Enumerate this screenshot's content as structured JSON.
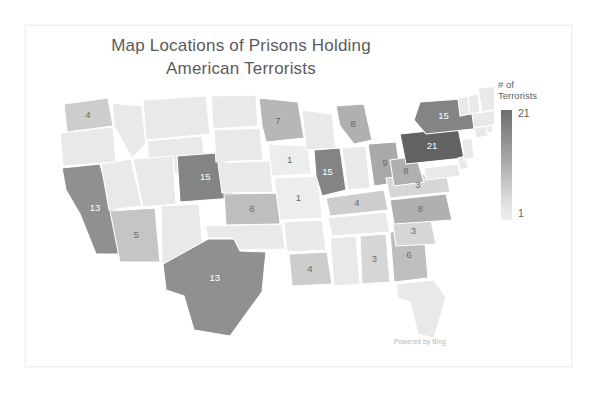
{
  "title": {
    "line1": "Map Locations of Prisons Holding",
    "line2": "American Terrorists"
  },
  "legend": {
    "title_line1": "# of",
    "title_line2": "Terrorists",
    "max": "21",
    "min": "1",
    "color_dark": "#6e6e6e",
    "color_light": "#efefef"
  },
  "attribution": "Powered by Bing",
  "chart_data": {
    "type": "heatmap",
    "title": "Map Locations of Prisons Holding American Terrorists",
    "xlabel": "",
    "ylabel": "",
    "legend_label": "# of Terrorists",
    "value_range": [
      1,
      21
    ],
    "grid": false,
    "legend_position": "right",
    "regions": [
      {
        "code": "WA",
        "name": "Washington",
        "value": 4,
        "label": "4"
      },
      {
        "code": "CA",
        "name": "California",
        "value": 13,
        "label": "13"
      },
      {
        "code": "AZ",
        "name": "Arizona",
        "value": 5,
        "label": "5"
      },
      {
        "code": "CO",
        "name": "Colorado",
        "value": 15,
        "label": "15"
      },
      {
        "code": "KS",
        "name": "Kansas",
        "value": 6,
        "label": "6"
      },
      {
        "code": "TX",
        "name": "Texas",
        "value": 13,
        "label": "13"
      },
      {
        "code": "MN",
        "name": "Minnesota",
        "value": 7,
        "label": "7"
      },
      {
        "code": "IA",
        "name": "Iowa",
        "value": 1,
        "label": "1"
      },
      {
        "code": "MO",
        "name": "Missouri",
        "value": 1,
        "label": "1"
      },
      {
        "code": "IL",
        "name": "Illinois",
        "value": 15,
        "label": "15"
      },
      {
        "code": "MI",
        "name": "Michigan",
        "value": 8,
        "label": "8"
      },
      {
        "code": "OH",
        "name": "Ohio",
        "value": 9,
        "label": "9"
      },
      {
        "code": "NY",
        "name": "New York",
        "value": 15,
        "label": "15"
      },
      {
        "code": "PA",
        "name": "Pennsylvania",
        "value": 21,
        "label": "21"
      },
      {
        "code": "WV",
        "name": "West Virginia",
        "value": 8,
        "label": "8"
      },
      {
        "code": "VA",
        "name": "Virginia",
        "value": 3,
        "label": "3"
      },
      {
        "code": "NC",
        "name": "North Carolina",
        "value": 8,
        "label": "8"
      },
      {
        "code": "SC",
        "name": "South Carolina",
        "value": 3,
        "label": "3"
      },
      {
        "code": "GA",
        "name": "Georgia",
        "value": 6,
        "label": "6"
      },
      {
        "code": "AL",
        "name": "Alabama",
        "value": 3,
        "label": "3"
      },
      {
        "code": "LA",
        "name": "Louisiana",
        "value": 4,
        "label": "4"
      },
      {
        "code": "KY",
        "name": "Kentucky",
        "value": 4,
        "label": "4"
      }
    ]
  }
}
